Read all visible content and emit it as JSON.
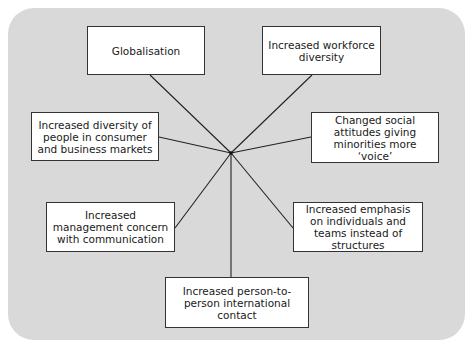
{
  "diagram": {
    "type": "hub-and-spoke",
    "background_color": "#d9d9d9",
    "box_color": "#ffffff",
    "line_color": "#222222",
    "center": {
      "x": 231,
      "y": 153
    },
    "nodes": [
      {
        "id": "globalisation",
        "label": "Globalisation",
        "x": 87,
        "y": 26,
        "w": 118,
        "h": 49,
        "anchor": [
          150,
          75
        ]
      },
      {
        "id": "workforce",
        "label": "Increased workforce diversity",
        "x": 262,
        "y": 26,
        "w": 119,
        "h": 49,
        "anchor": [
          312,
          75
        ]
      },
      {
        "id": "consumer",
        "label": "Increased diversity of people in consumer and business markets",
        "x": 31,
        "y": 112,
        "w": 128,
        "h": 49,
        "anchor": [
          159,
          137
        ]
      },
      {
        "id": "voice",
        "label": "Changed social attitudes giving minorities more ‘voice’",
        "x": 311,
        "y": 112,
        "w": 128,
        "h": 51,
        "anchor": [
          311,
          137
        ]
      },
      {
        "id": "management",
        "label": "Increased management concern with communication",
        "x": 46,
        "y": 202,
        "w": 129,
        "h": 50,
        "anchor": [
          175,
          228
        ]
      },
      {
        "id": "emphasis",
        "label": "Increased emphasis on individuals and teams instead of structures",
        "x": 293,
        "y": 202,
        "w": 130,
        "h": 50,
        "anchor": [
          293,
          228
        ]
      },
      {
        "id": "person",
        "label": "Increased person-to-person international contact",
        "x": 165,
        "y": 277,
        "w": 144,
        "h": 51,
        "anchor": [
          231,
          277
        ]
      }
    ]
  }
}
